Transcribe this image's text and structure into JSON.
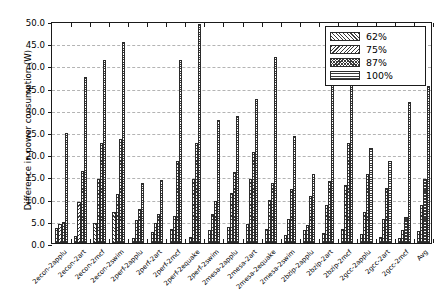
{
  "chart_data": {
    "type": "bar",
    "title": "",
    "xlabel": "",
    "ylabel": "Difference in power consumption (W)",
    "ylim": [
      0.0,
      50.0
    ],
    "ytick_step": 5.0,
    "yticks": [
      "0.0",
      "5.0",
      "10.0",
      "15.0",
      "20.0",
      "25.0",
      "30.0",
      "35.0",
      "40.0",
      "45.0",
      "50.0"
    ],
    "grid": "horizontal-dashed",
    "legend_position": "upper right",
    "legend": [
      "62%",
      "75%",
      "87%",
      "100%"
    ],
    "categories": [
      "2econ-2applu",
      "2econ-2art",
      "2econ-2mcf",
      "2econ-2swim",
      "2perf-2applu",
      "2perf-2art",
      "2perf-2mcf",
      "2perf-2equake",
      "2perf-2swim",
      "2mesa-2applu",
      "2mesa-2art",
      "2mesa-2equake",
      "2mesa-2swim",
      "2bzip-2applu",
      "2bzip-2art",
      "2bzip-2mcf",
      "2gcc-2applu",
      "2gcc-2art",
      "2gcc-2mcf",
      "Avg"
    ],
    "series": [
      {
        "name": "62%",
        "values": [
          3.4,
          1.6,
          4.4,
          7.0,
          1.2,
          2.5,
          3.2,
          1.4,
          3.0,
          3.5,
          4.3,
          3.1,
          1.8,
          3.0,
          2.2,
          3.2,
          2.0,
          1.4,
          1.2,
          2.8
        ]
      },
      {
        "name": "75%",
        "values": [
          4.2,
          9.2,
          14.5,
          11.0,
          5.2,
          4.5,
          6.0,
          14.5,
          6.5,
          11.2,
          14.5,
          9.8,
          5.5,
          4.0,
          8.5,
          13.0,
          7.0,
          5.5,
          3.0,
          8.5
        ]
      },
      {
        "name": "87%",
        "values": [
          4.8,
          16.2,
          22.5,
          23.5,
          7.6,
          6.5,
          18.5,
          22.6,
          9.4,
          16.0,
          20.5,
          13.5,
          12.2,
          10.5,
          14.0,
          22.5,
          15.5,
          12.5,
          5.8,
          14.5
        ]
      },
      {
        "name": "100%",
        "values": [
          24.7,
          37.3,
          41.2,
          45.2,
          13.5,
          14.2,
          41.3,
          49.4,
          27.8,
          28.6,
          32.5,
          41.8,
          24.0,
          15.5,
          36.8,
          42.0,
          21.5,
          18.5,
          31.8,
          35.3
        ]
      }
    ]
  },
  "figure": {
    "y_axis_label": "Difference in power consumption (W)"
  }
}
